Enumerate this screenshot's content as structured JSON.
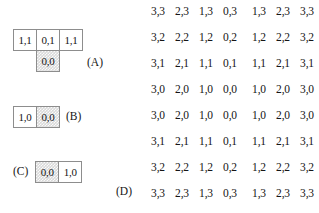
{
  "diagrams": [
    {
      "id": "A",
      "label": "(A)",
      "rows": [
        [
          {
            "text": "1,1",
            "shaded": false,
            "empty": false
          },
          {
            "text": "0,1",
            "shaded": false,
            "empty": false
          },
          {
            "text": "1,1",
            "shaded": false,
            "empty": false
          }
        ],
        [
          {
            "text": "",
            "shaded": false,
            "empty": true
          },
          {
            "text": "0,0",
            "shaded": true,
            "empty": false
          },
          {
            "text": "",
            "shaded": false,
            "empty": true
          }
        ]
      ]
    },
    {
      "id": "B",
      "label": "(B)",
      "rows": [
        [
          {
            "text": "1,0",
            "shaded": false,
            "empty": false
          },
          {
            "text": "0,0",
            "shaded": true,
            "empty": false
          }
        ]
      ]
    },
    {
      "id": "C",
      "label": "(C)",
      "rows": [
        [
          {
            "text": "0,0",
            "shaded": true,
            "empty": false
          },
          {
            "text": "1,0",
            "shaded": false,
            "empty": false
          }
        ]
      ]
    }
  ],
  "coord_grid": {
    "label_d": "(D)",
    "rows": [
      [
        "3,3",
        "2,3",
        "1,3",
        "0,3",
        "1,3",
        "2,3",
        "3,3"
      ],
      [
        "3,2",
        "2,2",
        "1,2",
        "0,2",
        "1,2",
        "2,2",
        "3,2"
      ],
      [
        "3,1",
        "2,1",
        "1,1",
        "0,1",
        "1,1",
        "2,1",
        "3,1"
      ],
      [
        "3,0",
        "2,0",
        "1,0",
        "0,0",
        "1,0",
        "2,0",
        "3,0"
      ],
      [
        "3,0",
        "2,0",
        "1,0",
        "0,0",
        "1,0",
        "2,0",
        "3,0"
      ],
      [
        "3,1",
        "2,1",
        "1,1",
        "0,1",
        "1,1",
        "2,1",
        "3,1"
      ],
      [
        "3,2",
        "2,2",
        "1,2",
        "0,2",
        "1,2",
        "2,2",
        "3,2"
      ],
      [
        "3,3",
        "2,3",
        "1,3",
        "0,3",
        "1,3",
        "2,3",
        "3,3"
      ]
    ]
  },
  "colors": {
    "cell_border": "#8d8d8d",
    "cell_shaded_fill": "#d9d9d9",
    "text": "#151515",
    "background": "#ffffff"
  }
}
